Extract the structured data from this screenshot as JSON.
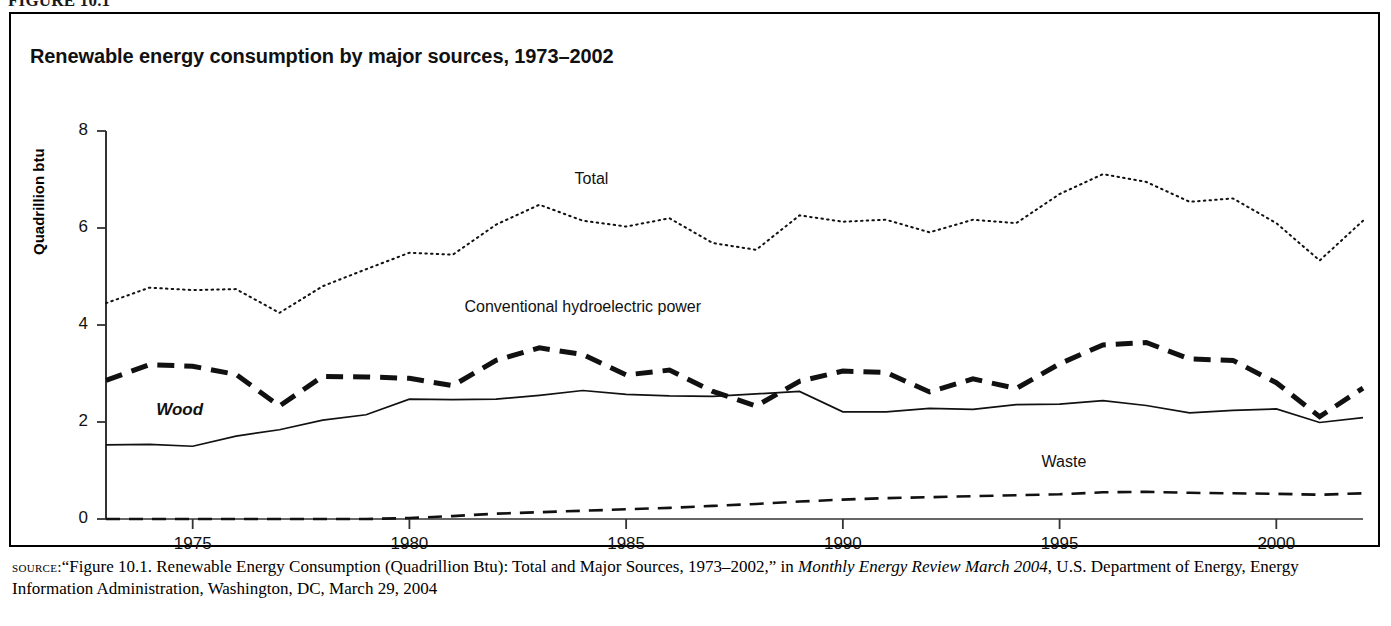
{
  "figure": {
    "number_label": "FIGURE 10.1",
    "title": "Renewable energy consumption by major sources, 1973–2002"
  },
  "axes": {
    "y_axis_title": "Quadrillion btu",
    "y_ticks": [
      "0",
      "2",
      "4",
      "6",
      "8"
    ],
    "x_ticks": [
      "1975",
      "1980",
      "1985",
      "1990",
      "1995",
      "2000"
    ]
  },
  "series_labels": {
    "total": "Total",
    "hydro": "Conventional hydroelectric power",
    "wood": "Wood",
    "waste": "Waste"
  },
  "source": {
    "kicker": "source:",
    "line1_a": "“Figure 10.1. Renewable Energy Consumption (Quadrillion Btu): Total and Major Sources, 1973–2002,” in ",
    "line1_italic": "Monthly Energy Review March 2004",
    "line1_b": ",",
    "line2": "U.S. Department of Energy, Energy Information Administration, Washington, DC, March 29, 2004"
  },
  "chart_data": {
    "type": "line",
    "title": "Renewable energy consumption by major sources, 1973–2002",
    "xlabel": "",
    "ylabel": "Quadrillion btu",
    "xlim": [
      1973,
      2002
    ],
    "ylim": [
      0,
      8
    ],
    "grid": false,
    "legend": "inline-annotations",
    "x": [
      1973,
      1974,
      1975,
      1976,
      1977,
      1978,
      1979,
      1980,
      1981,
      1982,
      1983,
      1984,
      1985,
      1986,
      1987,
      1988,
      1989,
      1990,
      1991,
      1992,
      1993,
      1994,
      1995,
      1996,
      1997,
      1998,
      1999,
      2000,
      2001,
      2002
    ],
    "series": [
      {
        "name": "Total",
        "style": "dotted",
        "values": [
          4.45,
          4.77,
          4.72,
          4.74,
          4.25,
          4.8,
          5.15,
          5.49,
          5.45,
          6.07,
          6.48,
          6.15,
          6.03,
          6.2,
          5.69,
          5.55,
          6.26,
          6.13,
          6.17,
          5.91,
          6.17,
          6.1,
          6.7,
          7.11,
          6.95,
          6.54,
          6.61,
          6.1,
          5.33,
          6.15
        ]
      },
      {
        "name": "Conventional hydroelectric power",
        "style": "dashed-thick",
        "values": [
          2.86,
          3.18,
          3.15,
          2.98,
          2.33,
          2.94,
          2.93,
          2.9,
          2.75,
          3.27,
          3.53,
          3.39,
          2.97,
          3.07,
          2.63,
          2.33,
          2.84,
          3.05,
          3.02,
          2.62,
          2.89,
          2.69,
          3.2,
          3.59,
          3.64,
          3.3,
          3.27,
          2.81,
          2.11,
          2.7
        ]
      },
      {
        "name": "Wood",
        "style": "solid-thin",
        "values": [
          1.53,
          1.54,
          1.5,
          1.71,
          1.84,
          2.04,
          2.15,
          2.47,
          2.46,
          2.47,
          2.55,
          2.65,
          2.57,
          2.54,
          2.53,
          2.58,
          2.63,
          2.21,
          2.21,
          2.28,
          2.26,
          2.36,
          2.37,
          2.44,
          2.34,
          2.19,
          2.24,
          2.27,
          1.99,
          2.09
        ]
      },
      {
        "name": "Waste",
        "style": "dashed-medium",
        "values": [
          0.0,
          0.0,
          0.0,
          0.0,
          0.0,
          0.0,
          0.0,
          0.02,
          0.06,
          0.11,
          0.14,
          0.17,
          0.2,
          0.23,
          0.27,
          0.31,
          0.36,
          0.4,
          0.43,
          0.45,
          0.47,
          0.49,
          0.51,
          0.55,
          0.56,
          0.54,
          0.53,
          0.52,
          0.5,
          0.53
        ]
      }
    ],
    "annotations": [
      {
        "text": "Total",
        "x": 1984.2,
        "y": 7.0
      },
      {
        "text": "Conventional hydroelectric power",
        "x": 1984.0,
        "y": 4.35
      },
      {
        "text": "Wood",
        "x": 1974.7,
        "y": 2.25
      },
      {
        "text": "Waste",
        "x": 1995.1,
        "y": 1.15
      }
    ]
  }
}
